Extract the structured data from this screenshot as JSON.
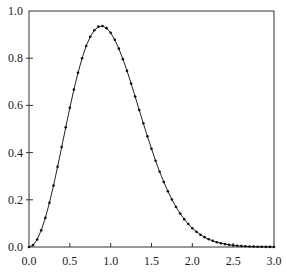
{
  "chart_data": {
    "type": "line",
    "title": "",
    "xlabel": "",
    "ylabel": "",
    "xlim": [
      0.0,
      3.0
    ],
    "ylim": [
      0.0,
      1.0
    ],
    "grid": false,
    "legend": null,
    "x_ticks": [
      "0.0",
      "0.5",
      "1.0",
      "1.5",
      "2.0",
      "2.5",
      "3.0"
    ],
    "y_ticks": [
      "0.0",
      "0.2",
      "0.4",
      "0.6",
      "0.8",
      "1.0"
    ],
    "series": [
      {
        "name": "curve",
        "style": "solid line with dot markers",
        "x": [
          0.0,
          0.05,
          0.1,
          0.15,
          0.2,
          0.25,
          0.3,
          0.35,
          0.4,
          0.45,
          0.5,
          0.55,
          0.6,
          0.65,
          0.7,
          0.75,
          0.8,
          0.85,
          0.9,
          0.95,
          1.0,
          1.05,
          1.1,
          1.15,
          1.2,
          1.25,
          1.3,
          1.35,
          1.4,
          1.45,
          1.5,
          1.55,
          1.6,
          1.65,
          1.7,
          1.75,
          1.8,
          1.85,
          1.9,
          1.95,
          2.0,
          2.05,
          2.1,
          2.15,
          2.2,
          2.25,
          2.3,
          2.35,
          2.4,
          2.45,
          2.5,
          2.55,
          2.6,
          2.65,
          2.7,
          2.75,
          2.8,
          2.85,
          2.9,
          2.95,
          3.0
        ],
        "values": [
          0.0,
          0.0081,
          0.032,
          0.0709,
          0.1233,
          0.1871,
          0.2602,
          0.3398,
          0.4232,
          0.5073,
          0.5896,
          0.6673,
          0.7381,
          0.7999,
          0.8519,
          0.8911,
          0.9187,
          0.9337,
          0.9364,
          0.9274,
          0.9076,
          0.8781,
          0.8405,
          0.796,
          0.7465,
          0.6929,
          0.6372,
          0.5805,
          0.524,
          0.4688,
          0.4158,
          0.3656,
          0.3188,
          0.2757,
          0.2364,
          0.2011,
          0.1697,
          0.1422,
          0.1181,
          0.0973,
          0.0796,
          0.0647,
          0.0521,
          0.0417,
          0.0331,
          0.0261,
          0.0204,
          0.0158,
          0.0122,
          0.0093,
          0.0071,
          0.0054,
          0.004,
          0.003,
          0.0022,
          0.0016,
          0.0012,
          0.0009,
          0.0006,
          0.0004,
          0.0003
        ]
      }
    ]
  },
  "layout": {
    "plot_left": 29,
    "plot_right": 274,
    "plot_top": 11,
    "plot_bottom": 247
  }
}
